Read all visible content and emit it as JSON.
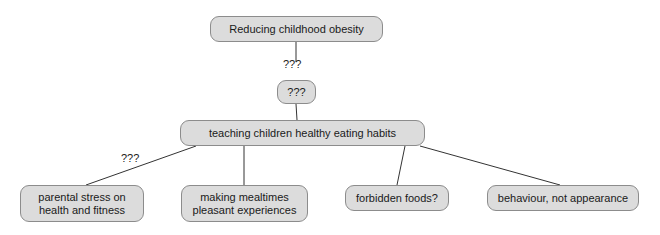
{
  "diagram": {
    "type": "concept-map",
    "nodes": [
      {
        "id": "root",
        "label": "Reducing childhood obesity",
        "x": 210,
        "y": 16,
        "w": 173,
        "h": 26
      },
      {
        "id": "unknown",
        "label": "???",
        "x": 277,
        "y": 80,
        "w": 39,
        "h": 24
      },
      {
        "id": "teaching",
        "label": "teaching children healthy eating habits",
        "x": 180,
        "y": 120,
        "w": 245,
        "h": 26
      },
      {
        "id": "stress",
        "label": "parental stress on\nhealth and fitness",
        "x": 20,
        "y": 185,
        "w": 124,
        "h": 37
      },
      {
        "id": "mealtimes",
        "label": "making mealtimes\npleasant experiences",
        "x": 181,
        "y": 185,
        "w": 127,
        "h": 37
      },
      {
        "id": "forbidden",
        "label": "forbidden foods?",
        "x": 345,
        "y": 185,
        "w": 104,
        "h": 26
      },
      {
        "id": "behaviour",
        "label": "behaviour, not appearance",
        "x": 487,
        "y": 185,
        "w": 152,
        "h": 26
      }
    ],
    "edges": [
      {
        "id": "root-unknown",
        "x1": 296,
        "y1": 42,
        "x2": 296,
        "y2": 62,
        "label": "???",
        "label_x": 283,
        "label_y": 58
      },
      {
        "id": "unknown-teaching",
        "x1": 296,
        "y1": 104,
        "x2": 297,
        "y2": 120,
        "label": ""
      },
      {
        "id": "teaching-stress",
        "x1": 196,
        "y1": 146,
        "x2": 86,
        "y2": 185,
        "label": "???",
        "label_x": 121,
        "label_y": 152
      },
      {
        "id": "teaching-mealtimes",
        "x1": 244,
        "y1": 146,
        "x2": 244,
        "y2": 185,
        "label": ""
      },
      {
        "id": "teaching-forbidden",
        "x1": 405,
        "y1": 146,
        "x2": 397,
        "y2": 185,
        "label": ""
      },
      {
        "id": "teaching-behaviour",
        "x1": 420,
        "y1": 146,
        "x2": 560,
        "y2": 185,
        "label": ""
      }
    ],
    "colors": {
      "node_fill": "#dcdcdc",
      "node_border": "#8c8c8c",
      "edge": "#333333",
      "text": "#1a1a1a",
      "background": "#ffffff"
    }
  }
}
